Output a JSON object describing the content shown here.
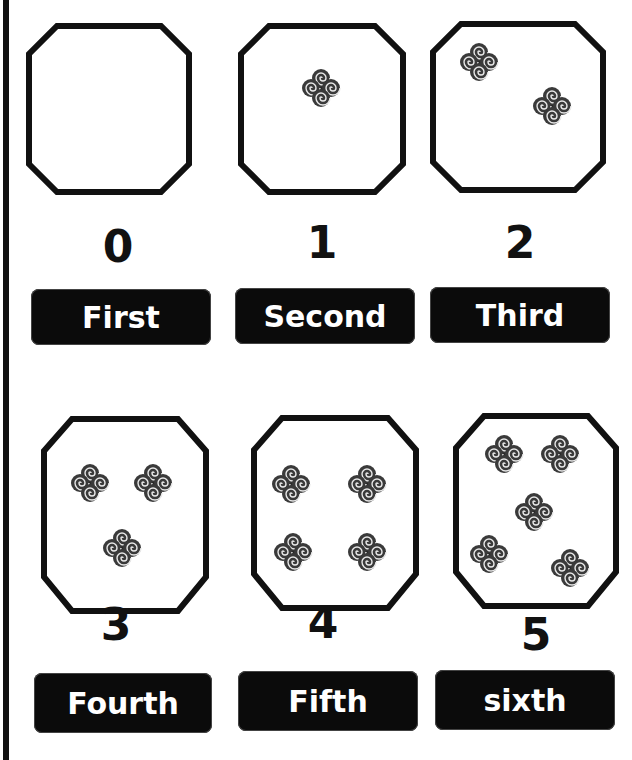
{
  "worksheet": {
    "instruction_partial": "",
    "accent_color": "#111111",
    "items": [
      {
        "count": "0",
        "ordinal_label": "First",
        "icon": "quad-spiral-icon",
        "icon_count": 0
      },
      {
        "count": "1",
        "ordinal_label": "Second",
        "icon": "quad-spiral-icon",
        "icon_count": 1
      },
      {
        "count": "2",
        "ordinal_label": "Third",
        "icon": "quad-spiral-icon",
        "icon_count": 2
      },
      {
        "count": "3",
        "ordinal_label": "Fourth",
        "icon": "quad-spiral-icon",
        "icon_count": 3
      },
      {
        "count": "4",
        "ordinal_label": "Fifth",
        "icon": "quad-spiral-icon",
        "icon_count": 4
      },
      {
        "count": "5",
        "ordinal_label": "sixth",
        "icon": "quad-spiral-icon",
        "icon_count": 5
      }
    ]
  }
}
